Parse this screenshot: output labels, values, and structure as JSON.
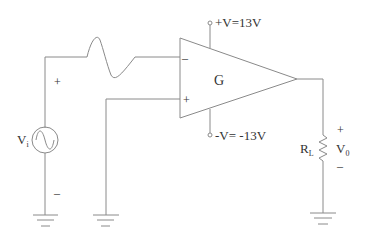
{
  "diagram": {
    "type": "op-amp circuit",
    "opamp": {
      "label": "G"
    },
    "supply_pos": {
      "label": "+V=13V"
    },
    "supply_neg": {
      "label": "-V= -13V"
    },
    "source": {
      "label": "V",
      "subscript": "i",
      "plus": "+",
      "minus": "–"
    },
    "inverting_input": {
      "symbol": "–"
    },
    "noninverting_input": {
      "symbol": "+"
    },
    "load": {
      "label": "R",
      "subscript": "L"
    },
    "output": {
      "label": "V",
      "subscript": "0",
      "plus": "+",
      "minus": "–"
    }
  }
}
